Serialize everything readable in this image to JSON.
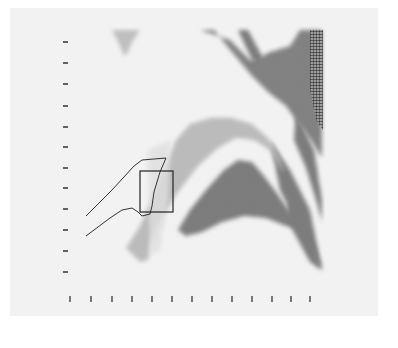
{
  "figure": {
    "type": "halftone-density-map",
    "background_color": "#f2f2f2",
    "ink_color": "#3a3a3a",
    "overlay_line_color": "#333333"
  },
  "axes": {
    "y_ticks": {
      "x": 65,
      "positions": [
        42,
        63,
        84,
        106,
        127,
        147,
        168,
        188,
        209,
        230,
        251,
        272
      ],
      "labels": []
    },
    "x_ticks": {
      "y": 299,
      "positions": [
        70,
        91,
        112,
        132,
        152,
        172,
        192,
        212,
        232,
        252,
        272,
        291,
        310
      ],
      "labels": []
    }
  },
  "regions": [
    {
      "name": "top-left-blob",
      "intensity": "medium-dark"
    },
    {
      "name": "upper-right-band",
      "intensity": "dark"
    },
    {
      "name": "right-edge-spike",
      "intensity": "dark"
    },
    {
      "name": "central-arch",
      "intensity": "medium"
    },
    {
      "name": "lower-wing",
      "intensity": "dark"
    },
    {
      "name": "lower-right-tail",
      "intensity": "dark"
    }
  ],
  "annotations": {
    "outline_shape": "curved-channel",
    "roi_box": {
      "x": 140,
      "y": 171,
      "width": 33,
      "height": 41
    }
  }
}
